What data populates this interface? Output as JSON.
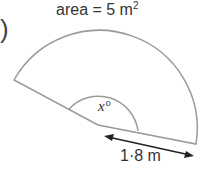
{
  "title": {
    "prefix": "area = 5 m",
    "exponent": "2"
  },
  "paren": ")",
  "angle_label": "x°",
  "radius_label": "1·8 m",
  "colors": {
    "stroke": "#9a9a9a",
    "text": "#333333",
    "arrow": "#222222"
  }
}
